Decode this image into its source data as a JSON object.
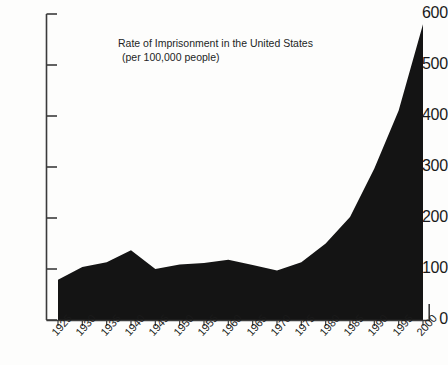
{
  "chart_data": {
    "type": "area",
    "title": "Rate of Imprisonment in the United States",
    "subtitle": "(per 100,000 people)",
    "xlabel": "",
    "ylabel": "",
    "xlim": [
      1925,
      2000
    ],
    "ylim": [
      0,
      600
    ],
    "grid": false,
    "legend": false,
    "fill_color": "#141414",
    "axis_color": "#3b3b3b",
    "background_color": "#fdfdfc",
    "x_tick_labels": [
      "1925",
      "1930",
      "1935",
      "1940",
      "1945",
      "1950",
      "1955",
      "1960",
      "1965",
      "1970",
      "1975",
      "1980",
      "1985",
      "1990",
      "1995",
      "2000"
    ],
    "y_tick_labels": [
      "0",
      "100",
      "200",
      "300",
      "400",
      "500",
      "600"
    ],
    "y_tick_values": [
      0,
      100,
      200,
      300,
      400,
      500,
      600
    ],
    "x": [
      1925,
      1930,
      1935,
      1940,
      1945,
      1950,
      1955,
      1960,
      1965,
      1970,
      1975,
      1980,
      1985,
      1990,
      1995,
      2000
    ],
    "values": [
      79,
      104,
      113,
      137,
      100,
      109,
      112,
      118,
      108,
      97,
      113,
      150,
      202,
      297,
      411,
      580
    ],
    "series": [
      {
        "name": "Rate of Imprisonment",
        "values": [
          79,
          104,
          113,
          137,
          100,
          109,
          112,
          118,
          108,
          97,
          113,
          150,
          202,
          297,
          411,
          580
        ]
      }
    ]
  }
}
